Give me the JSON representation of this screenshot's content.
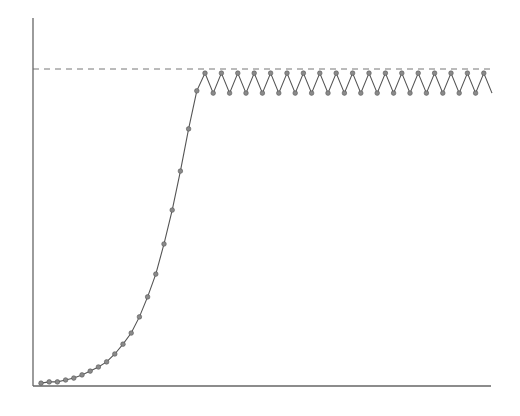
{
  "chart_data": {
    "type": "line",
    "title": "",
    "xlabel": "",
    "ylabel": "",
    "xticks": [],
    "yticks": [],
    "grid": false,
    "legend": null,
    "ylim": [
      0,
      1.0
    ],
    "reference_line": {
      "y": 1.0,
      "style": "dashed",
      "label": ""
    },
    "series": [
      {
        "name": "",
        "marker": "circle",
        "x": [
          0,
          1,
          2,
          3,
          4,
          5,
          6,
          7,
          8,
          9,
          10,
          11,
          12,
          13,
          14,
          15,
          16,
          17,
          18,
          19,
          20,
          21,
          22,
          23,
          24,
          25,
          26,
          27,
          28,
          29,
          30,
          31,
          32,
          33,
          34,
          35,
          36,
          37,
          38,
          39,
          40,
          41,
          42,
          43,
          44,
          45,
          46,
          47,
          48,
          49,
          50,
          51,
          52,
          53,
          54,
          55
        ],
        "values": [
          0.009,
          0.013,
          0.013,
          0.019,
          0.025,
          0.035,
          0.047,
          0.06,
          0.076,
          0.101,
          0.132,
          0.167,
          0.218,
          0.281,
          0.353,
          0.448,
          0.555,
          0.678,
          0.811,
          0.931,
          0.987,
          0.924,
          0.987,
          0.924,
          0.987,
          0.924,
          0.987,
          0.924,
          0.987,
          0.924,
          0.987,
          0.924,
          0.987,
          0.924,
          0.987,
          0.924,
          0.987,
          0.924,
          0.987,
          0.924,
          0.987,
          0.924,
          0.987,
          0.924,
          0.987,
          0.924,
          0.987,
          0.924,
          0.987,
          0.924,
          0.987,
          0.924,
          0.987,
          0.924,
          0.987,
          0.924
        ]
      }
    ]
  },
  "style": {
    "line_color": "#555555",
    "marker_fill": "#8a8a8a",
    "axis_color": "#666666",
    "dash_color": "#777777"
  }
}
